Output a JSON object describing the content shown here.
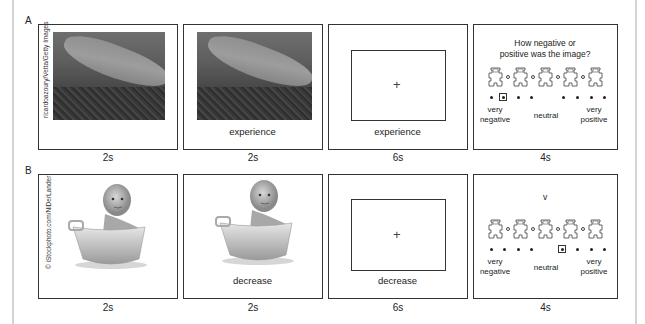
{
  "figure": {
    "rows": [
      {
        "label": "A",
        "frames": [
          {
            "type": "image",
            "image": "shark-photo",
            "credit": "ricardoazoury/Vetta/Getty Images",
            "duration": "2s"
          },
          {
            "type": "image-with-cue",
            "image": "shark-photo",
            "cue": "experience",
            "duration": "2s"
          },
          {
            "type": "fixation",
            "symbol": "+",
            "cue": "experience",
            "duration": "6s"
          },
          {
            "type": "rating",
            "question": [
              "How negative or",
              "positive was the image?"
            ],
            "selected_index": 1,
            "duration": "4s"
          }
        ]
      },
      {
        "label": "B",
        "frames": [
          {
            "type": "image",
            "image": "baby-in-tub-photo",
            "credit": "© iStockphoto.com/NiDerLander",
            "duration": "2s"
          },
          {
            "type": "image-with-cue",
            "image": "baby-in-tub-photo",
            "cue": "decrease",
            "duration": "2s"
          },
          {
            "type": "fixation",
            "symbol": "+",
            "cue": "decrease",
            "duration": "6s"
          },
          {
            "type": "rating",
            "question": [
              "v"
            ],
            "selected_index": 4,
            "duration": "4s"
          }
        ]
      }
    ],
    "rating_scale": {
      "points": 9,
      "mannequins": 5,
      "labels": {
        "left": [
          "very",
          "negative"
        ],
        "center": "neutral",
        "right": [
          "very",
          "positive"
        ]
      }
    }
  }
}
